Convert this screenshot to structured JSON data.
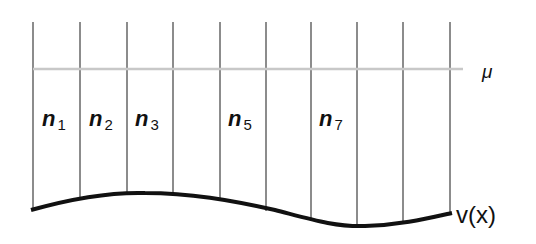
{
  "diagram": {
    "mu_label": "μ",
    "curve_label": "v(x)",
    "cells": [
      {
        "base": "n",
        "sub": "1",
        "x": 56
      },
      {
        "base": "n",
        "sub": "2",
        "x": 103
      },
      {
        "base": "n",
        "sub": "3",
        "x": 150
      },
      {
        "base": "n",
        "sub": "5",
        "x": 243
      },
      {
        "base": "n",
        "sub": "7",
        "x": 335
      }
    ],
    "colors": {
      "grid_line": "#8c8c8c",
      "mu_line": "#c8c8c8",
      "curve": "#111111",
      "text": "#111111"
    }
  }
}
